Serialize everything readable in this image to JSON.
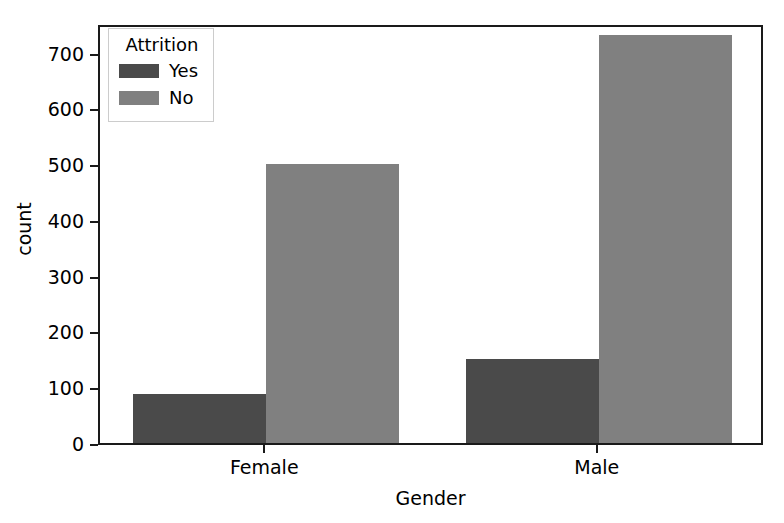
{
  "chart_data": {
    "type": "bar",
    "title": "",
    "xlabel": "Gender",
    "ylabel": "count",
    "categories": [
      "Female",
      "Male"
    ],
    "series": [
      {
        "name": "Yes",
        "values": [
          87,
          150
        ],
        "color": "#4a4a4a"
      },
      {
        "name": "No",
        "values": [
          501,
          732
        ],
        "color": "#808080"
      }
    ],
    "legend": {
      "title": "Attrition",
      "position": "upper left",
      "entries": [
        {
          "label": "Yes",
          "color": "#4a4a4a"
        },
        {
          "label": "No",
          "color": "#808080"
        }
      ]
    },
    "yticks": [
      0,
      100,
      200,
      300,
      400,
      500,
      600,
      700
    ],
    "ytick_labels": [
      "0",
      "100",
      "200",
      "300",
      "400",
      "500",
      "600",
      "700"
    ],
    "xtick_labels": [
      "Female",
      "Male"
    ],
    "ylim": [
      0,
      753
    ],
    "grid": false,
    "bar_mode": "dodge"
  },
  "axes": {
    "spine_color": "#1a1a1a",
    "background": "#ffffff"
  }
}
